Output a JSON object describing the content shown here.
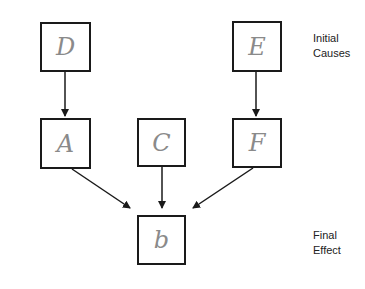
{
  "diagram": {
    "type": "causal-flow",
    "nodes": [
      {
        "id": "D",
        "label": "D",
        "level": "initial"
      },
      {
        "id": "E",
        "label": "E",
        "level": "initial"
      },
      {
        "id": "A",
        "label": "A",
        "level": "intermediate"
      },
      {
        "id": "C",
        "label": "C",
        "level": "intermediate"
      },
      {
        "id": "F",
        "label": "F",
        "level": "intermediate"
      },
      {
        "id": "b",
        "label": "b",
        "level": "final"
      }
    ],
    "edges": [
      {
        "from": "D",
        "to": "A"
      },
      {
        "from": "E",
        "to": "F"
      },
      {
        "from": "A",
        "to": "b"
      },
      {
        "from": "C",
        "to": "b"
      },
      {
        "from": "F",
        "to": "b"
      }
    ],
    "annotations": {
      "initial_line1": "Initial",
      "initial_line2": "Causes",
      "final_line1": "Final",
      "final_line2": "Effect"
    },
    "colors": {
      "box_border": "#1a1a1a",
      "handwritten_text": "#8a8a8a",
      "arrow": "#1a1a1a"
    }
  }
}
